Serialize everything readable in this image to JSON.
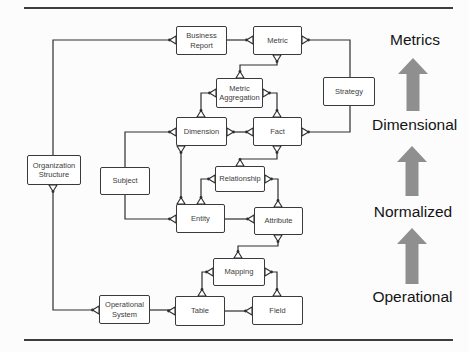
{
  "figure": {
    "nodes": {
      "business_report": {
        "label": "Business Report"
      },
      "metric": {
        "label": "Metric"
      },
      "metric_aggregation": {
        "label": "Metric Aggregation"
      },
      "strategy": {
        "label": "Strategy"
      },
      "dimension": {
        "label": "Dimension"
      },
      "fact": {
        "label": "Fact"
      },
      "organization_structure": {
        "label": "Organization Structure"
      },
      "subject": {
        "label": "Subject"
      },
      "relationship": {
        "label": "Relationship"
      },
      "entity": {
        "label": "Entity"
      },
      "attribute": {
        "label": "Attribute"
      },
      "mapping": {
        "label": "Mapping"
      },
      "operational_system": {
        "label": "Operational System"
      },
      "table": {
        "label": "Table"
      },
      "field": {
        "label": "Field"
      }
    },
    "levels": [
      {
        "label": "Metrics"
      },
      {
        "label": "Dimensional"
      },
      {
        "label": "Normalized"
      },
      {
        "label": "Operational"
      }
    ],
    "edges": [
      {
        "from": "organization_structure",
        "to": "business_report"
      },
      {
        "from": "business_report",
        "to": "metric"
      },
      {
        "from": "metric",
        "to": "strategy"
      },
      {
        "from": "strategy",
        "to": "fact"
      },
      {
        "from": "metric",
        "to": "metric_aggregation"
      },
      {
        "from": "metric_aggregation",
        "to": "dimension"
      },
      {
        "from": "metric_aggregation",
        "to": "fact"
      },
      {
        "from": "dimension",
        "to": "fact"
      },
      {
        "from": "dimension",
        "to": "subject"
      },
      {
        "from": "dimension",
        "to": "entity"
      },
      {
        "from": "fact",
        "to": "relationship"
      },
      {
        "from": "relationship",
        "to": "entity"
      },
      {
        "from": "relationship",
        "to": "attribute"
      },
      {
        "from": "subject",
        "to": "entity"
      },
      {
        "from": "entity",
        "to": "attribute"
      },
      {
        "from": "attribute",
        "to": "mapping"
      },
      {
        "from": "mapping",
        "to": "table"
      },
      {
        "from": "mapping",
        "to": "field"
      },
      {
        "from": "organization_structure",
        "to": "operational_system"
      },
      {
        "from": "operational_system",
        "to": "table"
      },
      {
        "from": "table",
        "to": "field"
      }
    ],
    "colors": {
      "arrow": "#8f8f8f",
      "line": "#2e2e2e",
      "box_border": "#3a3a3a",
      "rule": "#3d3d3d",
      "background": "#fcfcfc"
    }
  }
}
